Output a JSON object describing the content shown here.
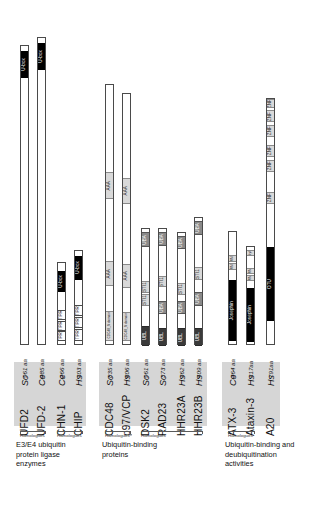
{
  "figure": {
    "type": "protein-domain-architecture-diagram",
    "groups": [
      {
        "id": "e3e4",
        "caption": "E3/E4 ubiquitin\nprotein ligase\nenzymes",
        "caption_lines": [
          "E3/E4 ubiquitin",
          "protein ligase",
          "enzymes"
        ],
        "homologue_label": "Homologues",
        "proteins": [
          {
            "name": "UFD2",
            "species": "Sc",
            "length_label": "961 aa",
            "length": 961,
            "domains": [
              {
                "label": "U-box",
                "style": "black",
                "start": 0.895,
                "end": 0.985
              }
            ]
          },
          {
            "name": "UFD-2",
            "species": "Ce",
            "length_label": "985 aa",
            "length": 985,
            "domains": [
              {
                "label": "U-box",
                "style": "black",
                "start": 0.895,
                "end": 0.985
              }
            ]
          },
          {
            "name": "CHN-1",
            "species": "Ce",
            "length_label": "266 aa",
            "length": 266,
            "domains": [
              {
                "label": "TPR",
                "style": "white",
                "start": 0.055,
                "end": 0.175
              },
              {
                "label": "TPR",
                "style": "white",
                "start": 0.185,
                "end": 0.305
              },
              {
                "label": "TPR",
                "style": "white",
                "start": 0.315,
                "end": 0.435
              },
              {
                "label": "U-box",
                "style": "black",
                "start": 0.655,
                "end": 0.9
              }
            ]
          },
          {
            "name": "CHIP",
            "species": "Hs",
            "length_label": "303 aa",
            "length": 303,
            "domains": [
              {
                "label": "TPR",
                "style": "white",
                "start": 0.055,
                "end": 0.175
              },
              {
                "label": "TPR",
                "style": "white",
                "start": 0.185,
                "end": 0.305
              },
              {
                "label": "TPR",
                "style": "white",
                "start": 0.315,
                "end": 0.435
              },
              {
                "label": "U-box",
                "style": "black",
                "start": 0.7,
                "end": 0.95
              }
            ]
          }
        ]
      },
      {
        "id": "ub-binding",
        "caption_lines": [
          "Ubiquitin-binding",
          "proteins"
        ],
        "homologue_label": "Homologues",
        "proteins": [
          {
            "name": "CDC48",
            "species": "Sc",
            "length_label": "835 aa",
            "length": 835,
            "domains": [
              {
                "label": "CDC48_N domain",
                "style": "light",
                "start": 0.02,
                "end": 0.135
              },
              {
                "label": "AAA",
                "style": "light",
                "start": 0.23,
                "end": 0.325
              },
              {
                "label": "AAA",
                "style": "light",
                "start": 0.565,
                "end": 0.665
              }
            ]
          },
          {
            "name": "p97/VCP",
            "species": "Hs",
            "length_label": "806 aa",
            "length": 806,
            "domains": [
              {
                "label": "CDC48_N domain",
                "style": "light",
                "start": 0.02,
                "end": 0.135
              },
              {
                "label": "AAA",
                "style": "light",
                "start": 0.23,
                "end": 0.325
              },
              {
                "label": "AAA",
                "style": "light",
                "start": 0.565,
                "end": 0.665
              }
            ]
          },
          {
            "name": "DSK2",
            "species": "Sc",
            "length_label": "961 aa",
            "length": 373,
            "domains": [
              {
                "label": "UBL",
                "style": "dark",
                "start": 0.0,
                "end": 0.175
              },
              {
                "label": "STI1",
                "style": "light",
                "start": 0.345,
                "end": 0.445
              },
              {
                "label": "STI1",
                "style": "light",
                "start": 0.455,
                "end": 0.555
              },
              {
                "label": "UBA",
                "style": "mid",
                "start": 0.845,
                "end": 0.975
              }
            ]
          },
          {
            "name": "RAD23",
            "species": "Sc",
            "length_label": "373 aa",
            "length": 373,
            "domains": [
              {
                "label": "UBL",
                "style": "dark",
                "start": 0.0,
                "end": 0.155
              },
              {
                "label": "UBA",
                "style": "mid",
                "start": 0.275,
                "end": 0.385
              },
              {
                "label": "STI1",
                "style": "light",
                "start": 0.5,
                "end": 0.6
              },
              {
                "label": "UBA",
                "style": "mid",
                "start": 0.855,
                "end": 0.975
              }
            ]
          },
          {
            "name": "HHR23A",
            "species": "Hs",
            "length_label": "362 aa",
            "length": 362,
            "domains": [
              {
                "label": "UBL",
                "style": "dark",
                "start": 0.0,
                "end": 0.155
              },
              {
                "label": "UBA",
                "style": "mid",
                "start": 0.285,
                "end": 0.395
              },
              {
                "label": "STI1",
                "style": "light",
                "start": 0.455,
                "end": 0.555
              },
              {
                "label": "UBA",
                "style": "mid",
                "start": 0.855,
                "end": 0.975
              }
            ]
          },
          {
            "name": "HHR23B",
            "species": "Hs",
            "length_label": "409 aa",
            "length": 409,
            "domains": [
              {
                "label": "UBL",
                "style": "dark",
                "start": 0.0,
                "end": 0.14
              },
              {
                "label": "UBA",
                "style": "mid",
                "start": 0.315,
                "end": 0.425
              },
              {
                "label": "STI1",
                "style": "light",
                "start": 0.515,
                "end": 0.615
              },
              {
                "label": "UBA",
                "style": "mid",
                "start": 0.865,
                "end": 0.975
              }
            ]
          }
        ]
      },
      {
        "id": "dub",
        "caption_lines": [
          "Ubiquitin-binding and",
          "deubiquitination",
          "activities"
        ],
        "homologue_label": "Homologues",
        "proteins": [
          {
            "name": "ATX-3",
            "species": "Ce",
            "length_label": "364 aa",
            "length": 364,
            "domains": [
              {
                "label": "Josephin",
                "style": "black",
                "start": 0.04,
                "end": 0.575
              },
              {
                "label": "UIM",
                "style": "light",
                "start": 0.665,
                "end": 0.725
              },
              {
                "label": "UIM",
                "style": "light",
                "start": 0.735,
                "end": 0.795
              }
            ]
          },
          {
            "name": "Ataxin-3",
            "species": "Hs",
            "length_label": "317aa",
            "length": 317,
            "domains": [
              {
                "label": "Josephin",
                "style": "black",
                "start": 0.04,
                "end": 0.585
              },
              {
                "label": "UIM",
                "style": "light",
                "start": 0.655,
                "end": 0.715
              },
              {
                "label": "UIM",
                "style": "light",
                "start": 0.725,
                "end": 0.785
              },
              {
                "label": "polyQ",
                "style": "light",
                "start": 0.905,
                "end": 0.965
              }
            ]
          },
          {
            "name": "A20",
            "species": "Hs",
            "length_label": "791aa",
            "length": 791,
            "domains": [
              {
                "label": "OTU",
                "style": "black",
                "start": 0.1,
                "end": 0.4
              },
              {
                "label": "ZNF",
                "style": "light",
                "start": 0.575,
                "end": 0.625
              },
              {
                "label": "ZNF",
                "style": "light",
                "start": 0.705,
                "end": 0.755
              },
              {
                "label": "ZNF",
                "style": "light",
                "start": 0.765,
                "end": 0.815
              },
              {
                "label": "ZNF",
                "style": "light",
                "start": 0.845,
                "end": 0.895
              },
              {
                "label": "ZNF",
                "style": "light",
                "start": 0.905,
                "end": 0.955
              },
              {
                "label": "ZNF",
                "style": "light",
                "start": 0.962,
                "end": 1.0
              }
            ]
          }
        ]
      }
    ]
  }
}
